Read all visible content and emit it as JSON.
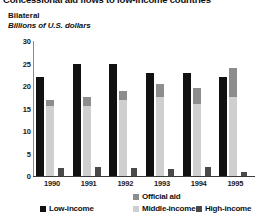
{
  "title": "Concessional aid flows to low-income countries",
  "panel": {
    "heading": "Bilateral",
    "subtitle": "Billions of U.S. dollars"
  },
  "legend": {
    "official_aid": "Official aid",
    "low_income": "Low-income",
    "middle_income": "Middle-income",
    "high_income": "High-income"
  },
  "colors": {
    "low_income": "#111111",
    "middle_income": "#cfcfcf",
    "official_aid": "#8d8d8d",
    "high_income": "#4a4a4a",
    "axis": "#3a3a3a",
    "background": "#ffffff"
  },
  "chart_data": {
    "type": "bar",
    "title": "Concessional aid flows to low-income countries",
    "subtitle": "Bilateral",
    "xlabel": "",
    "ylabel": "Billions of U.S. dollars",
    "ylim": [
      0,
      30
    ],
    "yticks": [
      0,
      5,
      10,
      15,
      20,
      25,
      30
    ],
    "grid": false,
    "legend_position": "bottom",
    "categories": [
      "1990",
      "1991",
      "1992",
      "1993",
      "1994",
      "1995"
    ],
    "series": [
      {
        "name": "Low-income",
        "values": [
          22.0,
          25.0,
          25.0,
          23.0,
          23.0,
          22.0
        ]
      },
      {
        "name": "Middle-income",
        "values": [
          15.5,
          15.5,
          17.0,
          17.5,
          16.0,
          17.5
        ]
      },
      {
        "name": "Official aid",
        "values": [
          1.5,
          2.0,
          2.0,
          3.0,
          3.5,
          6.5
        ],
        "stacked_on": "Middle-income"
      },
      {
        "name": "High-income",
        "values": [
          1.8,
          2.0,
          1.8,
          1.5,
          2.0,
          1.0
        ]
      }
    ]
  }
}
